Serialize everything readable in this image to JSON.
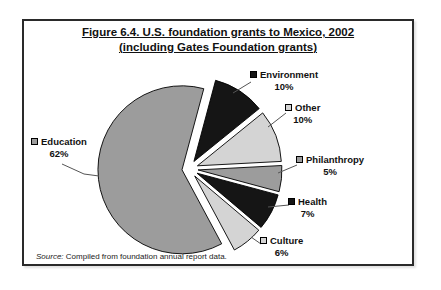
{
  "figure": {
    "title_line1": "Figure 6.4. U.S. foundation grants to Mexico, 2002",
    "title_line2": "(including Gates Foundation grants)",
    "source_prefix": "Source:",
    "source_text": "Compiled from foundation annual report data."
  },
  "chart_data": {
    "type": "pie",
    "title": "Figure 6.4. U.S. foundation grants to Mexico, 2002 (including Gates Foundation grants)",
    "units": "percent",
    "style": "exploded-pie",
    "legend_position": "callout-labels",
    "order_clockwise_from_top": [
      "Environment",
      "Other",
      "Philanthropy",
      "Health",
      "Culture",
      "Education"
    ],
    "slices": [
      {
        "label": "Environment",
        "value": 10,
        "percent_label": "10%",
        "color": "#151515"
      },
      {
        "label": "Other",
        "value": 10,
        "percent_label": "10%",
        "color": "#d4d4d4"
      },
      {
        "label": "Philanthropy",
        "value": 5,
        "percent_label": "5%",
        "color": "#9c9c9c"
      },
      {
        "label": "Health",
        "value": 7,
        "percent_label": "7%",
        "color": "#151515"
      },
      {
        "label": "Culture",
        "value": 6,
        "percent_label": "6%",
        "color": "#d4d4d4"
      },
      {
        "label": "Education",
        "value": 62,
        "percent_label": "62%",
        "color": "#9c9c9c"
      }
    ],
    "source_note": "Source: Compiled from foundation annual report data."
  }
}
